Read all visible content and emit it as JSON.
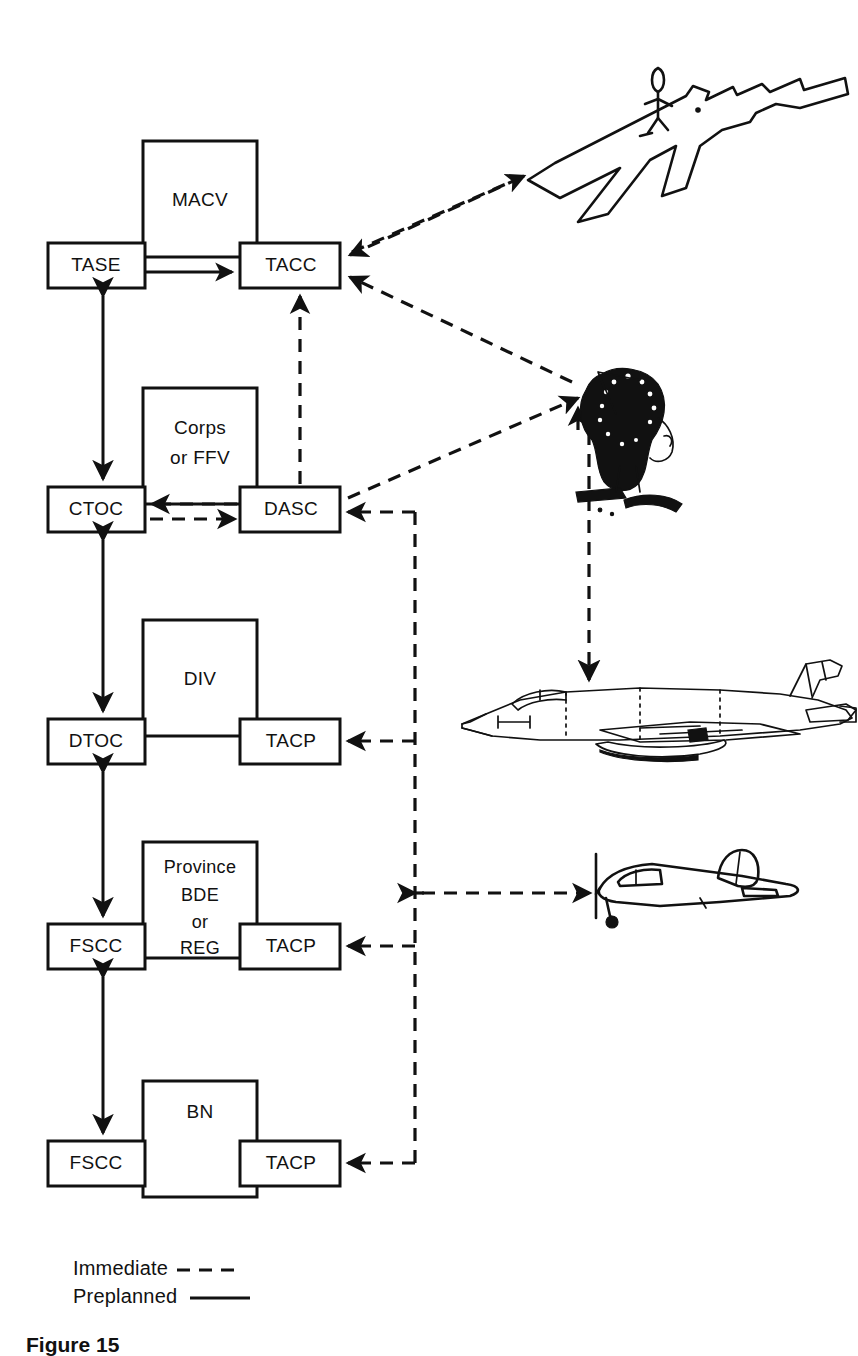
{
  "figure": {
    "caption": "Figure 15"
  },
  "legend": {
    "items": [
      {
        "label": "Immediate",
        "style": "dashed"
      },
      {
        "label": "Preplanned",
        "style": "solid"
      }
    ]
  },
  "colors": {
    "ink": "#111111",
    "paper": "#ffffff"
  },
  "nodes": {
    "macv": {
      "label": "MACV",
      "x": 143,
      "y": 141,
      "w": 114,
      "h": 116,
      "kind": "command-box"
    },
    "tase": {
      "label": "TASE",
      "x": 48,
      "y": 243,
      "w": 97,
      "h": 45,
      "kind": "cell-box"
    },
    "tacc": {
      "label": "TACC",
      "x": 240,
      "y": 243,
      "w": 100,
      "h": 45,
      "kind": "cell-box"
    },
    "corps": {
      "label": "Corps\nor FFV",
      "line1": "Corps",
      "line2": "or FFV",
      "x": 143,
      "y": 388,
      "w": 114,
      "h": 116,
      "kind": "command-box"
    },
    "ctoc": {
      "label": "CTOC",
      "x": 48,
      "y": 487,
      "w": 97,
      "h": 45,
      "kind": "cell-box"
    },
    "dasc": {
      "label": "DASC",
      "x": 240,
      "y": 487,
      "w": 100,
      "h": 45,
      "kind": "cell-box"
    },
    "div": {
      "label": "DIV",
      "x": 143,
      "y": 620,
      "w": 114,
      "h": 116,
      "kind": "command-box"
    },
    "dtoc": {
      "label": "DTOC",
      "x": 48,
      "y": 719,
      "w": 97,
      "h": 45,
      "kind": "cell-box"
    },
    "tacp_div": {
      "label": "TACP",
      "x": 240,
      "y": 719,
      "w": 100,
      "h": 45,
      "kind": "cell-box"
    },
    "province": {
      "label": "Province\nBDE\nor\nREG",
      "line1": "Province",
      "line2": "BDE",
      "line3": "or",
      "line4": "REG",
      "x": 143,
      "y": 842,
      "w": 114,
      "h": 116,
      "kind": "command-box"
    },
    "fscc_bde": {
      "label": "FSCC",
      "x": 48,
      "y": 924,
      "w": 97,
      "h": 45,
      "kind": "cell-box"
    },
    "tacp_bde": {
      "label": "TACP",
      "x": 240,
      "y": 924,
      "w": 100,
      "h": 45,
      "kind": "cell-box"
    },
    "bn": {
      "label": "BN",
      "x": 143,
      "y": 1081,
      "w": 114,
      "h": 116,
      "kind": "command-box"
    },
    "fscc_bn": {
      "label": "FSCC",
      "x": 48,
      "y": 1141,
      "w": 97,
      "h": 45,
      "kind": "cell-box"
    },
    "tacp_bn": {
      "label": "TACP",
      "x": 240,
      "y": 1141,
      "w": 100,
      "h": 45,
      "kind": "cell-box"
    }
  },
  "illustrations": [
    {
      "name": "airfield-aircraft-overhead",
      "caption": "Aircraft on airfield with figure"
    },
    {
      "name": "forward-air-controller-soldier",
      "caption": "Forward air controller with radio"
    },
    {
      "name": "jet-fighter-aircraft",
      "caption": "Jet fighter aircraft"
    },
    {
      "name": "observation-propeller-aircraft",
      "caption": "Light observation aircraft"
    }
  ],
  "connections": [
    {
      "from": "tase",
      "to": "tacc",
      "style": "solid",
      "direction": "one-way"
    },
    {
      "from": "tase",
      "to": "ctoc",
      "style": "solid",
      "direction": "two-way"
    },
    {
      "from": "ctoc",
      "to": "dtoc",
      "style": "solid",
      "direction": "two-way"
    },
    {
      "from": "dtoc",
      "to": "fscc_bde",
      "style": "solid",
      "direction": "two-way"
    },
    {
      "from": "fscc_bde",
      "to": "fscc_bn",
      "style": "solid",
      "direction": "two-way"
    },
    {
      "from": "dasc",
      "to": "tacc",
      "style": "dashed",
      "direction": "one-way"
    },
    {
      "from": "dasc",
      "to": "ctoc",
      "style": "dashed",
      "direction": "two-way"
    },
    {
      "from": "airfield-aircraft-overhead",
      "to": "tacc",
      "style": "dashed",
      "direction": "two-way"
    },
    {
      "from": "forward-air-controller-soldier",
      "to": "tacc",
      "style": "dashed",
      "direction": "one-way"
    },
    {
      "from": "forward-air-controller-soldier",
      "to": "dasc",
      "style": "dashed",
      "direction": "one-way"
    },
    {
      "from": "request-bus",
      "to": "dasc",
      "style": "dashed",
      "direction": "one-way"
    },
    {
      "from": "request-bus",
      "to": "tacp_div",
      "style": "dashed",
      "direction": "one-way"
    },
    {
      "from": "request-bus",
      "to": "tacp_bde",
      "style": "dashed",
      "direction": "one-way"
    },
    {
      "from": "request-bus",
      "to": "tacp_bn",
      "style": "dashed",
      "direction": "one-way"
    },
    {
      "from": "request-bus",
      "to": "observation-propeller-aircraft",
      "style": "dashed",
      "direction": "two-way"
    },
    {
      "from": "forward-air-controller-soldier",
      "to": "jet-fighter-aircraft",
      "style": "dashed",
      "direction": "one-way"
    }
  ]
}
